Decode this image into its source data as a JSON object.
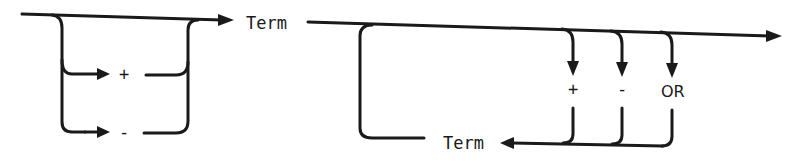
{
  "diagram": {
    "type": "syntax-railroad-diagram",
    "stroke_color": "#1a1a1a",
    "background": "#ffffff",
    "left_section": {
      "description": "optional unary sign before Term",
      "options": [
        {
          "label": "+"
        },
        {
          "label": "-"
        }
      ],
      "target": "Term"
    },
    "right_section": {
      "description": "repeatable: operator followed by Term",
      "operators": [
        {
          "label": "+"
        },
        {
          "label": "-"
        },
        {
          "label": "OR"
        }
      ],
      "loop_term": "Term"
    }
  }
}
